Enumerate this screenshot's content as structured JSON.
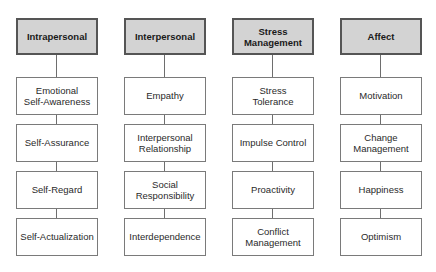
{
  "diagram": {
    "columns": [
      {
        "header": "Intrapersonal",
        "items": [
          "Emotional\nSelf-Awareness",
          "Self-Assurance",
          "Self-Regard",
          "Self-Actualization"
        ]
      },
      {
        "header": "Interpersonal",
        "items": [
          "Empathy",
          "Interpersonal\nRelationship",
          "Social\nResponsibility",
          "Interdependence"
        ]
      },
      {
        "header": "Stress\nManagement",
        "items": [
          "Stress\nTolerance",
          "Impulse Control",
          "Proactivity",
          "Conflict\nManagement"
        ]
      },
      {
        "header": "Affect",
        "items": [
          "Motivation",
          "Change\nManagement",
          "Happiness",
          "Optimism"
        ]
      }
    ],
    "colors": {
      "header_fill": "#d3d3d3",
      "header_border": "#555555",
      "item_border": "#7a7a7a",
      "connector": "#6e6e6e"
    }
  }
}
